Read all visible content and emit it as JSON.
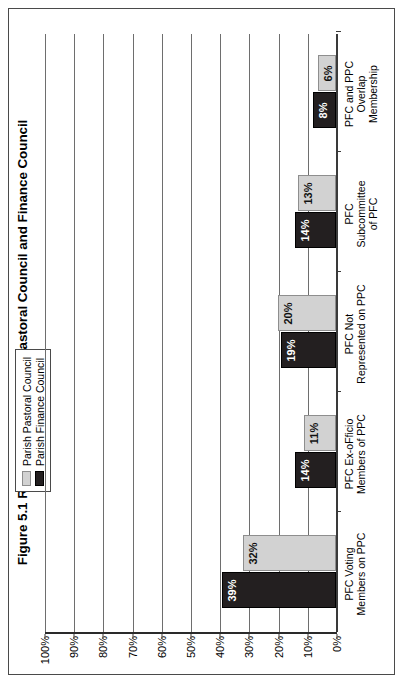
{
  "figure": {
    "title": "Figure 5.1 Relationship between Pastoral Council and Finance Council",
    "border_color": "#4a4a4a"
  },
  "legend": {
    "position": "top-center",
    "items": [
      {
        "label": "Parish Pastoral Council",
        "color": "#d2d2d2",
        "swatch_name": "legend-swatch-pastoral"
      },
      {
        "label": "Parish Finance Council",
        "color": "#231f20",
        "swatch_name": "legend-swatch-finance"
      }
    ]
  },
  "axis": {
    "y_ticks": [
      "100%",
      "90%",
      "80%",
      "70%",
      "60%",
      "50%",
      "40%",
      "30%",
      "20%",
      "10%",
      "0%"
    ],
    "y_min": 0,
    "y_max": 100
  },
  "chart_data": {
    "type": "bar",
    "title": "Figure 5.1 Relationship between Pastoral Council and Finance Council",
    "xlabel": "",
    "ylabel": "",
    "ylim": [
      0,
      100
    ],
    "grid": true,
    "legend_position": "top-center",
    "orientation": "vertical-bars-rotated-page",
    "categories": [
      "PFC Voting\nMembers on PPC",
      "PFC Ex-oFficio\nMembers of PPC",
      "PFC Not\nRepresented on PPC",
      "PFC\nSubcommittee\nof PFC",
      "PFC and PPC\nOverlap\nMembership"
    ],
    "category_lines": [
      [
        "PFC Voting",
        "Members on PPC"
      ],
      [
        "PFC Ex-oFficio",
        "Members of PPC"
      ],
      [
        "PFC Not",
        "Represented on PPC"
      ],
      [
        "PFC",
        "Subcommittee",
        "of PFC"
      ],
      [
        "PFC and PPC",
        "Overlap",
        "Membership"
      ]
    ],
    "series": [
      {
        "name": "Parish Finance Council",
        "color": "#231f20",
        "values": [
          39,
          14,
          19,
          14,
          8
        ],
        "labels": [
          "39%",
          "14%",
          "19%",
          "14%",
          "8%"
        ]
      },
      {
        "name": "Parish Pastoral Council",
        "color": "#d2d2d2",
        "values": [
          32,
          11,
          20,
          13,
          6
        ],
        "labels": [
          "32%",
          "11%",
          "20%",
          "13%",
          "6%"
        ]
      }
    ]
  }
}
